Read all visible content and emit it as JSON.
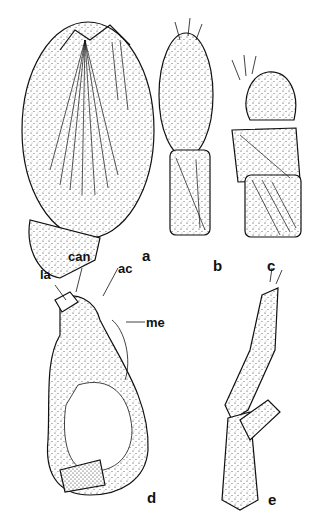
{
  "figure": {
    "panels": [
      {
        "id": "a",
        "label": "a"
      },
      {
        "id": "b",
        "label": "b"
      },
      {
        "id": "c",
        "label": "c"
      },
      {
        "id": "d",
        "label": "d"
      },
      {
        "id": "e",
        "label": "e"
      }
    ],
    "annotations": {
      "la": "la",
      "can": "can",
      "ac": "ac",
      "me": "me"
    }
  }
}
